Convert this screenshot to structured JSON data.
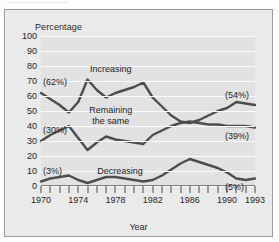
{
  "caption": {
    "clipped_top_text": "——————————"
  },
  "chart_data": {
    "type": "line",
    "title": "",
    "xlabel": "Year",
    "ylabel": "Percentage",
    "ylim": [
      0,
      100
    ],
    "ytick_labels": [
      "0",
      "10",
      "20",
      "30",
      "40",
      "50",
      "60",
      "70",
      "80",
      "90",
      "100"
    ],
    "yticks": [
      0,
      10,
      20,
      30,
      40,
      50,
      60,
      70,
      80,
      90,
      100
    ],
    "xlim": [
      1970,
      1993
    ],
    "x": [
      1970,
      1971,
      1972,
      1973,
      1974,
      1975,
      1976,
      1977,
      1978,
      1979,
      1980,
      1981,
      1982,
      1983,
      1984,
      1985,
      1986,
      1987,
      1988,
      1989,
      1990,
      1991,
      1992,
      1993
    ],
    "xtick_labels": [
      "1970",
      "1974",
      "1978",
      "1982",
      "1986",
      "1990",
      "1993"
    ],
    "xtick_label_values": [
      1970,
      1974,
      1978,
      1982,
      1986,
      1990,
      1993
    ],
    "grid": "horizontal",
    "legend_position": "inline-annotations",
    "series": [
      {
        "name": "Increasing",
        "color": "#4d4d4d",
        "values": [
          62,
          58,
          54,
          49,
          56,
          71,
          64,
          59,
          62,
          64,
          66,
          69,
          59,
          53,
          47,
          43,
          42,
          44,
          47,
          50,
          52,
          56,
          55,
          54
        ],
        "start_label": "(62%)",
        "end_label": "(54%)"
      },
      {
        "name": "Remaining\nthe same",
        "color": "#4d4d4d",
        "values": [
          30,
          34,
          37,
          40,
          32,
          24,
          29,
          33,
          31,
          30,
          29,
          28,
          34,
          37,
          40,
          42,
          43,
          42,
          41,
          41,
          40,
          40,
          40,
          39
        ],
        "start_label": "(30%)",
        "end_label": "(39%)"
      },
      {
        "name": "Decreasing",
        "color": "#4d4d4d",
        "values": [
          3,
          5,
          6,
          7,
          4,
          2,
          4,
          6,
          6,
          5,
          4,
          3,
          4,
          7,
          11,
          15,
          18,
          16,
          14,
          12,
          9,
          5,
          4,
          5
        ],
        "start_label": "(3%)",
        "end_label": "(5%)"
      }
    ],
    "annotations": [
      {
        "text": "Increasing",
        "x": 1977.5,
        "y": 78
      },
      {
        "text": "Remaining the same",
        "x": 1977.5,
        "y": 47
      },
      {
        "text": "Decreasing",
        "x": 1978.5,
        "y": 10
      }
    ]
  },
  "colors": {
    "page_background": "#fdfdfd",
    "figure_background": "#eaeaea",
    "plot_background": "#e2e2e2",
    "gridline": "#fbfbfb",
    "line": "#4d4d4d",
    "text": "#1c1c1c",
    "frame_border": "#9a9a9a"
  }
}
